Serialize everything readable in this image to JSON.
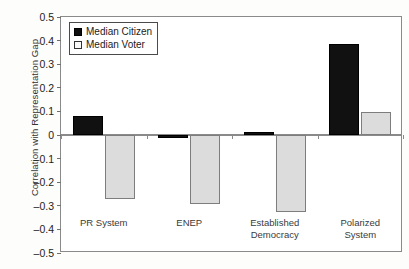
{
  "chart_data": {
    "type": "bar",
    "title": "",
    "xlabel": "",
    "ylabel": "Correlation with Representation Gap",
    "ylim": [
      -0.5,
      0.5
    ],
    "ytick_step": 0.1,
    "ytick_labels": [
      "0.5",
      "0.4",
      "0.3",
      "0.2",
      "0.1",
      "0",
      "–0.1",
      "–0.2",
      "–0.3",
      "–0.4",
      "–0.5"
    ],
    "ytick_values": [
      0.5,
      0.4,
      0.3,
      0.2,
      0.1,
      0,
      -0.1,
      -0.2,
      -0.3,
      -0.4,
      -0.5
    ],
    "grid": false,
    "categories": [
      "PR System",
      "ENEP",
      "Established Democracy",
      "Polarized System"
    ],
    "series": [
      {
        "name": "Median Citizen",
        "color": "#111111",
        "values": [
          0.08,
          -0.012,
          0.012,
          0.385
        ]
      },
      {
        "name": "Median Voter",
        "color": "#dcdcdc",
        "values": [
          -0.27,
          -0.292,
          -0.326,
          0.098
        ]
      }
    ],
    "legend": {
      "position": "top-left",
      "entries": [
        {
          "label": "Median Citizen",
          "swatch": "filled-black-square"
        },
        {
          "label": "Median Voter",
          "swatch": "open-white-square"
        }
      ]
    }
  }
}
